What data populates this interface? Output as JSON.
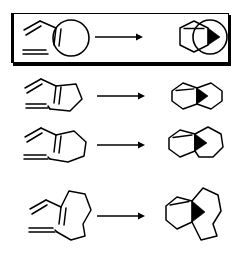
{
  "figure": {
    "background_color": "#ffffff",
    "line_color": "#000000",
    "highlight_border_color": "#000000",
    "highlight_shadow_color": "#000000"
  },
  "rows": [
    {
      "id": "row-1",
      "highlighted": true,
      "reactant": {
        "name": "diene-dienophile-with-generic-ring-tether",
        "description": "1,3-diene attached to a circle representing a generic cyclic tether bearing a pendant vinyl dienophile",
        "tether_representation": "circle",
        "diene_count": 1,
        "dienophile_count": 1
      },
      "arrow": {
        "name": "reaction-arrow",
        "direction": "right"
      },
      "product": {
        "name": "cyclohexene-fused-to-generic-ring",
        "description": "newly formed cyclohexene ring fused to the generic circle tether",
        "rings": [
          "hexagon",
          "circle"
        ],
        "fusion": "fused"
      }
    },
    {
      "id": "row-2",
      "highlighted": false,
      "reactant": {
        "name": "diene-short-tether-dienophile",
        "description": "1,3-diene on a short carbon tether terminating in a vinyl dienophile",
        "tether_representation": "chain",
        "tether_atoms": 3,
        "diene_count": 1,
        "dienophile_count": 1
      },
      "arrow": {
        "name": "reaction-arrow",
        "direction": "right"
      },
      "product": {
        "name": "cis-fused-bicyclic-hexagon-hexagon",
        "description": "two six-membered rings sharing an edge, new stereocenter drawn as bold wedge",
        "rings": [
          "hexagon",
          "hexagon"
        ],
        "fusion": "fused"
      }
    },
    {
      "id": "row-3",
      "highlighted": false,
      "reactant": {
        "name": "diene-medium-tether-dienophile",
        "description": "1,3-diene on a medium carbon tether terminating in a vinyl dienophile",
        "tether_representation": "chain",
        "tether_atoms": 4,
        "diene_count": 1,
        "dienophile_count": 1
      },
      "arrow": {
        "name": "reaction-arrow",
        "direction": "right"
      },
      "product": {
        "name": "fused-bicyclic-hexagon-heptagon",
        "description": "cyclohexene fused to a seven-membered ring, new stereocenter drawn as bold wedge",
        "rings": [
          "hexagon",
          "heptagon"
        ],
        "fusion": "fused"
      }
    },
    {
      "id": "row-4",
      "highlighted": false,
      "reactant": {
        "name": "diene-long-tether-dienophile",
        "description": "1,3-diene on a long carbon tether terminating in a vinyl dienophile",
        "tether_representation": "chain",
        "tether_atoms": 6,
        "diene_count": 1,
        "dienophile_count": 1
      },
      "arrow": {
        "name": "reaction-arrow",
        "direction": "right"
      },
      "product": {
        "name": "fused-bicyclic-hexagon-macrocycle",
        "description": "cyclohexene fused to a larger macrocyclic ring, new stereocenter drawn as bold wedge",
        "rings": [
          "hexagon",
          "macrocycle"
        ],
        "fusion": "fused"
      }
    }
  ]
}
